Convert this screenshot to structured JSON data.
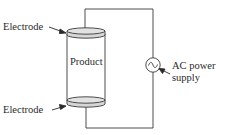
{
  "diagram": {
    "type": "circuit-schematic",
    "labels": {
      "top_electrode": "Electrode",
      "product": "Product",
      "bottom_electrode": "Electrode",
      "ac_supply_line1": "AC power",
      "ac_supply_line2": "supply"
    },
    "components": [
      {
        "id": "top-electrode",
        "kind": "electrode-disc"
      },
      {
        "id": "product",
        "kind": "cylinder"
      },
      {
        "id": "bottom-electrode",
        "kind": "electrode-disc"
      },
      {
        "id": "ac-source",
        "kind": "ac-voltage-source",
        "symbol": "~"
      }
    ],
    "connections": [
      [
        "top-electrode",
        "ac-source"
      ],
      [
        "ac-source",
        "bottom-electrode"
      ]
    ],
    "colors": {
      "line": "#3a3a3a",
      "electrode_fill": "#d9d9d9",
      "text": "#2a2a2a"
    }
  }
}
